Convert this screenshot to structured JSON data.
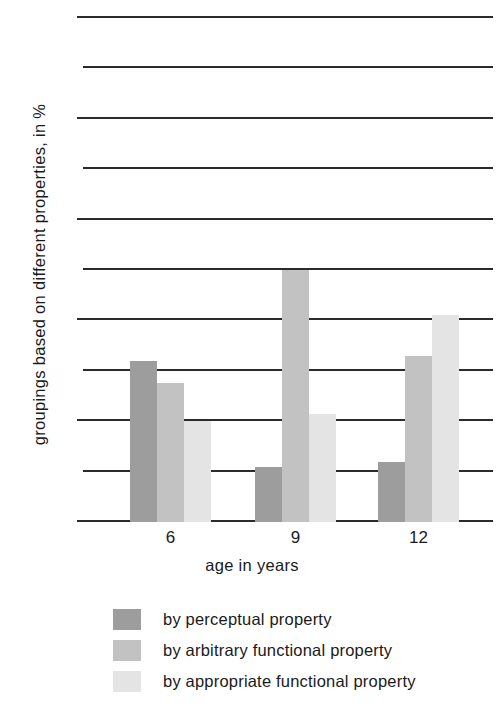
{
  "chart_data": {
    "type": "bar",
    "title": "",
    "xlabel": "age in years",
    "ylabel": "groupings based on different properties, in %",
    "categories": [
      "6",
      "9",
      "12"
    ],
    "series": [
      {
        "name": "by perceptual property",
        "color": "#9d9d9d",
        "values": [
          32,
          11,
          12
        ]
      },
      {
        "name": "by arbitrary functional property",
        "color": "#c2c2c2",
        "values": [
          27.5,
          50,
          33
        ]
      },
      {
        "name": "by appropriate functional property",
        "color": "#e4e4e4",
        "values": [
          20,
          21.5,
          41
        ]
      }
    ],
    "ylim": [
      0,
      100
    ],
    "yticks": [
      0,
      20,
      40,
      60,
      80,
      100
    ],
    "ytick_labels": [
      "0",
      "20",
      "40",
      "60",
      "80",
      "100"
    ],
    "minor_gridlines": [
      10,
      30,
      50,
      70,
      90
    ],
    "grid": true,
    "legend_position": "bottom-left"
  },
  "legend": {
    "items": [
      {
        "label": "by perceptual property",
        "color": "#9d9d9d"
      },
      {
        "label": "by arbitrary functional property",
        "color": "#c2c2c2"
      },
      {
        "label": "by appropriate functional property",
        "color": "#e4e4e4"
      }
    ]
  },
  "axes": {
    "y_label": "groupings based on different properties, in %",
    "x_label": "age in years",
    "y_ticks": [
      "100",
      "80",
      "60",
      "40",
      "20",
      "0"
    ],
    "x_ticks": [
      "6",
      "9",
      "12"
    ]
  }
}
